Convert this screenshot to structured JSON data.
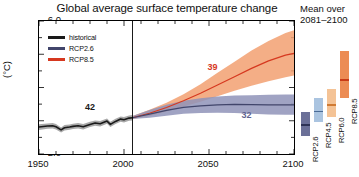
{
  "chart_data": {
    "type": "line",
    "title": "Global average surface temperature change",
    "xlabel": "",
    "ylabel": "(°C)",
    "xlim": [
      1950,
      2100
    ],
    "ylim": [
      -2.0,
      6.0
    ],
    "xticks": [
      "1950",
      "2000",
      "2050",
      "2100"
    ],
    "yticks": [
      "6.0",
      "4.0",
      "2.0",
      "0.0",
      "−2.0"
    ],
    "grid": false,
    "legend_position": "top-left",
    "historical_end_year": 2005,
    "series": [
      {
        "name": "historical",
        "color": "#1a1a1a",
        "band_color": "#9a9a9a",
        "model_count": "42",
        "x": [
          1950,
          1955,
          1958,
          1960,
          1963,
          1965,
          1968,
          1970,
          1973,
          1976,
          1980,
          1983,
          1986,
          1990,
          1992,
          1995,
          1998,
          2000,
          2003,
          2005
        ],
        "values": [
          -0.38,
          -0.32,
          -0.3,
          -0.36,
          -0.55,
          -0.42,
          -0.38,
          -0.34,
          -0.3,
          -0.36,
          -0.22,
          -0.14,
          -0.18,
          -0.02,
          -0.22,
          -0.04,
          0.1,
          0.06,
          0.16,
          0.18
        ],
        "band_low": [
          -0.55,
          -0.48,
          -0.46,
          -0.52,
          -0.7,
          -0.58,
          -0.54,
          -0.5,
          -0.46,
          -0.52,
          -0.38,
          -0.3,
          -0.34,
          -0.18,
          -0.38,
          -0.2,
          -0.06,
          -0.1,
          0.0,
          0.02
        ],
        "band_high": [
          -0.21,
          -0.16,
          -0.14,
          -0.2,
          -0.4,
          -0.26,
          -0.22,
          -0.18,
          -0.14,
          -0.2,
          -0.06,
          0.02,
          -0.02,
          0.14,
          -0.06,
          0.12,
          0.26,
          0.22,
          0.32,
          0.34
        ]
      },
      {
        "name": "RCP2.6",
        "color": "#41456b",
        "band_color": "#8f93b8",
        "model_count": "32",
        "x": [
          2005,
          2015,
          2025,
          2035,
          2045,
          2055,
          2065,
          2075,
          2085,
          2095,
          2100
        ],
        "values": [
          0.18,
          0.4,
          0.62,
          0.8,
          0.9,
          0.96,
          0.98,
          0.97,
          0.95,
          0.95,
          0.96
        ],
        "band_low": [
          0.1,
          0.18,
          0.3,
          0.42,
          0.46,
          0.48,
          0.46,
          0.42,
          0.38,
          0.36,
          0.36
        ],
        "band_high": [
          0.28,
          0.64,
          0.96,
          1.2,
          1.36,
          1.46,
          1.52,
          1.54,
          1.56,
          1.58,
          1.58
        ]
      },
      {
        "name": "RCP8.5",
        "color": "#d6381f",
        "band_color": "#f2a071",
        "model_count": "39",
        "x": [
          2005,
          2015,
          2025,
          2035,
          2045,
          2055,
          2065,
          2075,
          2085,
          2095,
          2100
        ],
        "values": [
          0.18,
          0.45,
          0.8,
          1.2,
          1.65,
          2.15,
          2.65,
          3.15,
          3.6,
          3.95,
          4.05
        ],
        "band_low": [
          0.1,
          0.28,
          0.55,
          0.85,
          1.15,
          1.48,
          1.8,
          2.1,
          2.38,
          2.62,
          2.72
        ],
        "band_high": [
          0.28,
          0.66,
          1.08,
          1.6,
          2.2,
          2.88,
          3.55,
          4.22,
          4.8,
          5.28,
          5.45
        ]
      }
    ],
    "annotations": [
      {
        "text": "42",
        "x": 1980,
        "y": 0.62,
        "color": "#1a1a1a"
      },
      {
        "text": "39",
        "x": 2052,
        "y": 3.05,
        "color": "#d6381f"
      },
      {
        "text": "32",
        "x": 2072,
        "y": 0.18,
        "color": "#5f6490"
      }
    ],
    "mean_panel": {
      "caption_line1": "Mean over",
      "caption_line2": "2081–2100",
      "bars": [
        {
          "label": "RCP2.6",
          "color": "#6b7098",
          "mean_color": "#2e3356",
          "low": 0.3,
          "high": 1.7,
          "mean": 1.0
        },
        {
          "label": "RCP4.5",
          "color": "#aac4e0",
          "mean_color": "#4a6b95",
          "low": 1.1,
          "high": 2.6,
          "mean": 1.8
        },
        {
          "label": "RCP6.0",
          "color": "#f4c396",
          "mean_color": "#d07a33",
          "low": 1.4,
          "high": 3.1,
          "mean": 2.2
        },
        {
          "label": "RCP8.5",
          "color": "#ec8c54",
          "mean_color": "#c93b16",
          "low": 2.6,
          "high": 5.4,
          "mean": 3.7
        }
      ]
    }
  }
}
